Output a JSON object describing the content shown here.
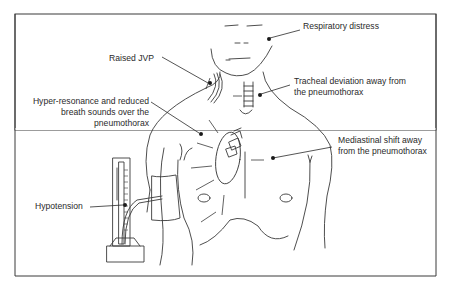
{
  "labels": {
    "respiratory_distress": "Respiratory distress",
    "raised_jvp": "Raised JVP",
    "tracheal_line1": "Tracheal deviation away from",
    "tracheal_line2": "the pneumothorax",
    "hyper_line1": "Hyper-resonance and reduced",
    "hyper_line2": "breath sounds over the",
    "hyper_line3": "pneumothorax",
    "mediastinal_line1": "Mediastinal shift away",
    "mediastinal_line2": "from the pneumothorax",
    "hypotension": "Hypotension"
  },
  "icons": {
    "figure": "human-torso-illustration",
    "manometer": "sphygmomanometer-icon",
    "trachea": "trachea-icon",
    "heart": "heart-icon"
  }
}
